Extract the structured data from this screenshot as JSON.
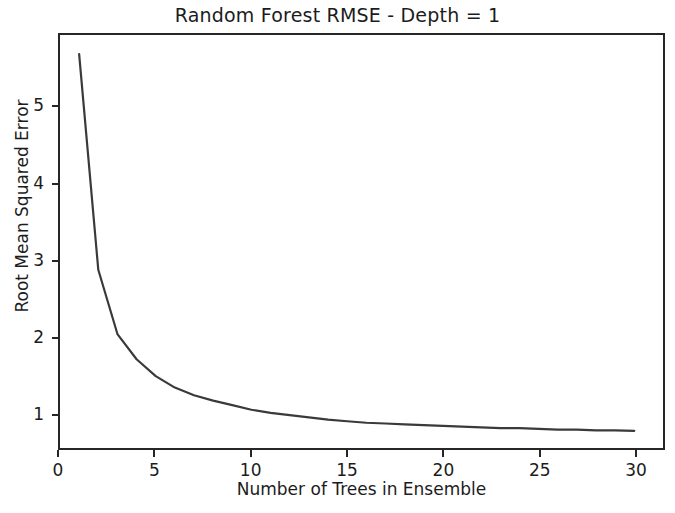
{
  "chart_data": {
    "type": "line",
    "title": "Random Forest RMSE - Depth = 1",
    "xlabel": "Number of Trees in Ensemble",
    "ylabel": "Root Mean Squared Error",
    "xlim": [
      0.0,
      31.5
    ],
    "ylim": [
      0.55,
      5.95
    ],
    "xticks": [
      0,
      5,
      10,
      15,
      20,
      25,
      30
    ],
    "xticklabels": [
      "0",
      "5",
      "10",
      "15",
      "20",
      "25",
      "30"
    ],
    "yticks": [
      1,
      2,
      3,
      4,
      5
    ],
    "yticklabels": [
      "1",
      "2",
      "3",
      "4",
      "5"
    ],
    "grid": false,
    "legend": false,
    "line_color": "#3a3a3a",
    "line_width": 2.0,
    "series": [
      {
        "name": "RMSE",
        "x": [
          1,
          2,
          3,
          4,
          5,
          6,
          7,
          8,
          9,
          10,
          11,
          12,
          13,
          14,
          15,
          16,
          17,
          18,
          19,
          20,
          21,
          22,
          23,
          24,
          25,
          26,
          27,
          28,
          29,
          30
        ],
        "values": [
          5.7,
          2.88,
          2.04,
          1.71,
          1.49,
          1.34,
          1.24,
          1.17,
          1.11,
          1.05,
          1.01,
          0.98,
          0.95,
          0.92,
          0.9,
          0.88,
          0.87,
          0.86,
          0.85,
          0.84,
          0.83,
          0.82,
          0.81,
          0.81,
          0.8,
          0.79,
          0.79,
          0.78,
          0.78,
          0.775
        ]
      }
    ]
  }
}
